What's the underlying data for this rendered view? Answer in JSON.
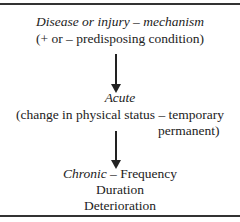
{
  "diagram": {
    "node1": {
      "title": "Disease or injury – mechanism",
      "subtitle": "(+ or – predisposing condition)"
    },
    "node2": {
      "title": "Acute",
      "line1": "(change in physical status – temporary",
      "line2": "permanent)"
    },
    "node3": {
      "title": "Chronic",
      "dash": " – Frequency",
      "line2": "Duration",
      "line3": "Deterioration"
    },
    "arrows": [
      "down-arrow",
      "down-arrow"
    ]
  }
}
